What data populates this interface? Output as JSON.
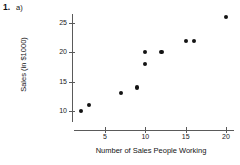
{
  "problem": {
    "number": "1.",
    "part": "a)"
  },
  "chart_data": {
    "type": "scatter",
    "title": "",
    "xlabel": "Number of Sales People Working",
    "ylabel": "Sales (in $1000)",
    "xlim": [
      0,
      21.5
    ],
    "ylim": [
      8.5,
      27
    ],
    "grid": false,
    "legend": null,
    "xticks": [
      5,
      10,
      15,
      20
    ],
    "xtick_labels": [
      "5",
      "10",
      "15",
      "20"
    ],
    "yticks": [
      10,
      15,
      20,
      25
    ],
    "ytick_labels": [
      "10",
      "15",
      "20",
      "25"
    ],
    "marker": "filled-circle",
    "marker_color": "#131313",
    "points": [
      {
        "x": 2,
        "y": 10
      },
      {
        "x": 3,
        "y": 11
      },
      {
        "x": 7,
        "y": 13
      },
      {
        "x": 9,
        "y": 14
      },
      {
        "x": 10,
        "y": 18
      },
      {
        "x": 10,
        "y": 20
      },
      {
        "x": 12,
        "y": 20
      },
      {
        "x": 15,
        "y": 22
      },
      {
        "x": 16,
        "y": 22
      },
      {
        "x": 20,
        "y": 26
      }
    ],
    "x": [
      2,
      3,
      7,
      9,
      10,
      10,
      12,
      15,
      16,
      20
    ],
    "values": [
      10,
      11,
      13,
      14,
      18,
      20,
      20,
      22,
      22,
      26
    ]
  }
}
